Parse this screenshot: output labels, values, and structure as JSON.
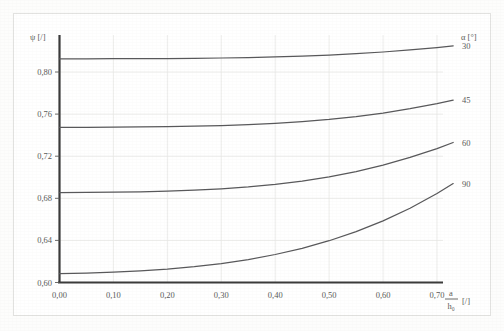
{
  "chart_data": {
    "type": "line",
    "title": "",
    "xlabel": "a/h₀ [/]",
    "ylabel": "ψ [/]",
    "legend_title": "α [°]",
    "legend_position": "right",
    "grid": true,
    "xlim": [
      0.0,
      0.75
    ],
    "ylim": [
      0.6,
      0.82
    ],
    "x_ticks": [
      "0,00",
      "0,10",
      "0,20",
      "0,30",
      "0,40",
      "0,50",
      "0,60",
      "0,70"
    ],
    "x_tick_values": [
      0.0,
      0.1,
      0.2,
      0.3,
      0.4,
      0.5,
      0.6,
      0.7
    ],
    "y_ticks": [
      "0,80",
      "0,76",
      "0,72",
      "0,68",
      "0,64",
      "0,60"
    ],
    "y_tick_values": [
      0.8,
      0.76,
      0.72,
      0.68,
      0.64,
      0.6
    ],
    "x": [
      0.0,
      0.05,
      0.1,
      0.15,
      0.2,
      0.25,
      0.3,
      0.35,
      0.4,
      0.45,
      0.5,
      0.55,
      0.6,
      0.65,
      0.7,
      0.73
    ],
    "series": [
      {
        "name": "30",
        "label": "30",
        "color": "#58585a",
        "values": [
          0.8125,
          0.8125,
          0.8126,
          0.8127,
          0.8128,
          0.813,
          0.8133,
          0.8137,
          0.8143,
          0.8151,
          0.8161,
          0.8174,
          0.819,
          0.821,
          0.8232,
          0.8248
        ]
      },
      {
        "name": "45",
        "label": "45",
        "color": "#58585a",
        "values": [
          0.7475,
          0.7475,
          0.7476,
          0.7478,
          0.7481,
          0.7485,
          0.7491,
          0.75,
          0.7512,
          0.7528,
          0.7549,
          0.7576,
          0.761,
          0.7651,
          0.7699,
          0.7732
        ]
      },
      {
        "name": "60",
        "label": "60",
        "color": "#58585a",
        "values": [
          0.6855,
          0.6856,
          0.6858,
          0.6862,
          0.6868,
          0.6877,
          0.689,
          0.6908,
          0.6932,
          0.6964,
          0.7004,
          0.7054,
          0.7115,
          0.7188,
          0.7272,
          0.733
        ]
      },
      {
        "name": "90",
        "label": "90",
        "color": "#58585a",
        "values": [
          0.6085,
          0.609,
          0.6098,
          0.611,
          0.6127,
          0.615,
          0.618,
          0.6218,
          0.6266,
          0.6325,
          0.6397,
          0.6483,
          0.6585,
          0.6705,
          0.6845,
          0.694
        ]
      }
    ]
  },
  "axes": {
    "y_axis_label": "ψ [/]",
    "x_axis_label_numerator": "a",
    "x_axis_label_denominator": "h₀",
    "x_axis_label_unit": "[/]"
  },
  "legend": {
    "title_symbol": "α",
    "title_unit": "[°]",
    "title": "α [°]",
    "entries": [
      "30",
      "45",
      "60",
      "90"
    ]
  },
  "colors": {
    "curve": "#58585a",
    "axis": "#3a3a3a",
    "grid": "#e8e8e6",
    "text": "#5a5a58",
    "page": "#ffffff"
  }
}
